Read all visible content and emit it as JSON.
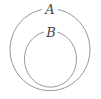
{
  "diagram": {
    "type": "euler",
    "sets": [
      {
        "label": "A",
        "role": "outer"
      },
      {
        "label": "B",
        "role": "inner",
        "subset_of": "A"
      }
    ],
    "stroke_color": "#8a8a8a"
  }
}
